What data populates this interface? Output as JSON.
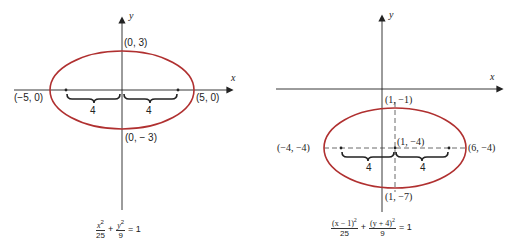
{
  "colors": {
    "ellipse": "#b03030",
    "axes": "#222222",
    "text": "#222222"
  },
  "figures": [
    {
      "name": "ellipse-centered-origin",
      "axes": {
        "x_label": "x",
        "y_label": "y"
      },
      "points": {
        "top": "(0, 3)",
        "bottom": "(0, − 3)",
        "left": "(−5, 0)",
        "right": "(5, 0)"
      },
      "brace_labels": [
        "4",
        "4"
      ],
      "equation": {
        "term1_num": "x",
        "term1_exp": "2",
        "term1_den": "25",
        "plus": "+",
        "term2_num": "y",
        "term2_exp": "2",
        "term2_den": "9",
        "rhs": "= 1"
      }
    },
    {
      "name": "ellipse-shifted",
      "axes": {
        "x_label": "x",
        "y_label": "y"
      },
      "points": {
        "top": "(1, −1)",
        "center": "(1, −4)",
        "bottom": "(1, −7)",
        "left": "(−4, −4)",
        "right": "(6, −4)"
      },
      "brace_labels": [
        "4",
        "4"
      ],
      "equation": {
        "term1_num": "(x − 1)",
        "term1_exp": "2",
        "term1_den": "25",
        "plus": "+",
        "term2_num": "(y + 4)",
        "term2_exp": "2",
        "term2_den": "9",
        "rhs": "= 1"
      }
    }
  ]
}
